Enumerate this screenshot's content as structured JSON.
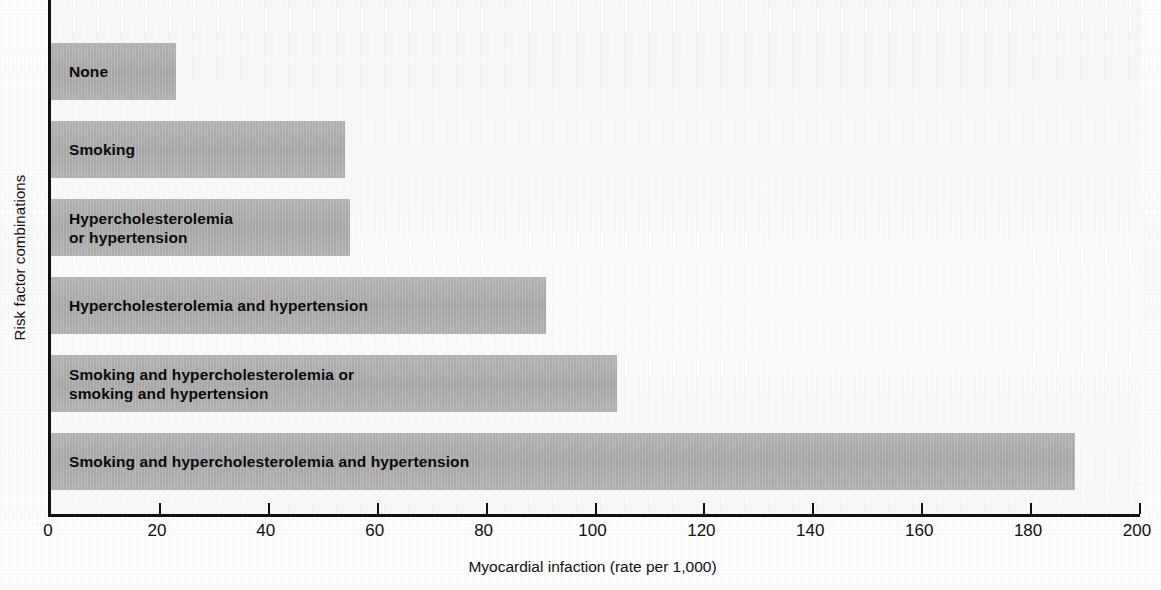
{
  "chart_data": {
    "type": "bar",
    "orientation": "horizontal",
    "title": "",
    "xlabel": "Myocardial infaction (rate per 1,000)",
    "ylabel": "Risk factor combinations",
    "categories": [
      "None",
      "Smoking",
      "Hypercholesterolemia\nor hypertension",
      "Hypercholesterolemia and hypertension",
      "Smoking and hypercholesterolemia or\nsmoking and hypertension",
      "Smoking and hypercholesterolemia and hypertension"
    ],
    "values": [
      23,
      54,
      55,
      91,
      104,
      188
    ],
    "xlim": [
      0,
      200
    ],
    "xticks": [
      0,
      20,
      40,
      60,
      80,
      100,
      120,
      140,
      160,
      180,
      200
    ],
    "xtick_labels": [
      "0",
      "20",
      "40",
      "60",
      "80",
      "100",
      "120",
      "140",
      "160",
      "180",
      "200"
    ],
    "grid": false,
    "legend": false,
    "bar_color": "#b0b0b0",
    "axis_color": "#111111",
    "plot_background": "#f8f8f8"
  }
}
